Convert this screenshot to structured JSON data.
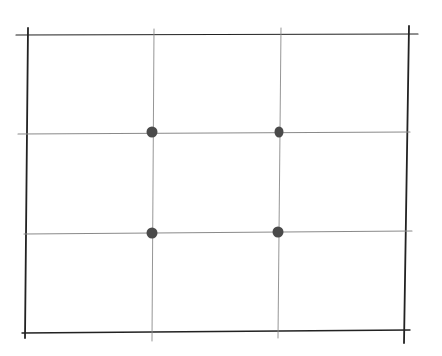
{
  "diagram": {
    "type": "grid",
    "background": "#ffffff",
    "colors": {
      "border_line": "#222222",
      "grid_line": "#8a8a8a",
      "dot": "#4a4a4a"
    },
    "border": {
      "left": {
        "x1": 28,
        "y1": 28,
        "x2": 25,
        "y2": 338
      },
      "right": {
        "x1": 409,
        "y1": 26,
        "x2": 404,
        "y2": 343
      },
      "top": {
        "x1": 16,
        "y1": 35,
        "x2": 418,
        "y2": 34
      },
      "bottom": {
        "x1": 22,
        "y1": 333,
        "x2": 410,
        "y2": 330
      }
    },
    "grid_lines": {
      "horizontal": [
        {
          "x1": 18,
          "y1": 134,
          "x2": 410,
          "y2": 132
        },
        {
          "x1": 24,
          "y1": 234,
          "x2": 412,
          "y2": 231
        }
      ],
      "vertical": [
        {
          "x1": 154,
          "y1": 29,
          "x2": 152,
          "y2": 341
        },
        {
          "x1": 281,
          "y1": 28,
          "x2": 278,
          "y2": 338
        }
      ]
    },
    "dots": [
      {
        "cx": 152,
        "cy": 132,
        "r": 5.5
      },
      {
        "cx": 279,
        "cy": 132,
        "rx": 4.5,
        "ry": 5.5
      },
      {
        "cx": 152,
        "cy": 233,
        "r": 5.5
      },
      {
        "cx": 278,
        "cy": 232,
        "r": 5.5
      }
    ]
  }
}
